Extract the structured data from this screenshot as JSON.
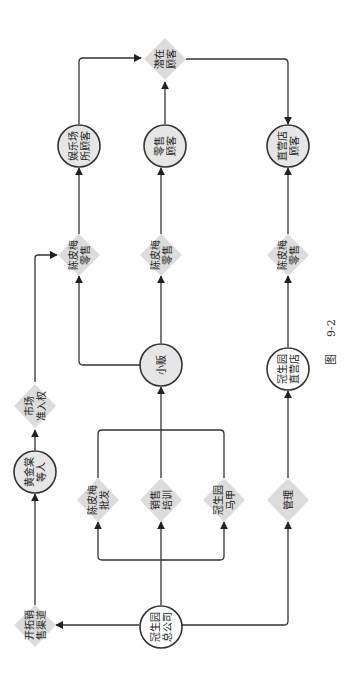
{
  "diagram": {
    "orientation": "rotated-90-ccw",
    "caption": {
      "prefix": "图",
      "number": "9-2"
    },
    "nodes": {
      "hq": {
        "shape": "circle",
        "lines": [
          "冠生园",
          "总公司"
        ]
      },
      "expand": {
        "shape": "diamond",
        "lines": [
          "开拓销",
          "售渠道"
        ]
      },
      "gold": {
        "shape": "circle",
        "lines": [
          "黄金棠",
          "等人"
        ]
      },
      "market": {
        "shape": "diamond",
        "lines": [
          "市场",
          "准入权"
        ]
      },
      "wholesale": {
        "shape": "diamond",
        "lines": [
          "陈皮梅",
          "批发"
        ]
      },
      "training": {
        "shape": "diamond",
        "lines": [
          "销售",
          "培训"
        ]
      },
      "vest": {
        "shape": "diamond",
        "lines": [
          "冠生园",
          "马甲"
        ]
      },
      "manage": {
        "shape": "diamond",
        "lines": [
          "管理"
        ]
      },
      "vendor": {
        "shape": "circle",
        "lines": [
          "小贩"
        ]
      },
      "store": {
        "shape": "circle",
        "lines": [
          "冠生园",
          "直营店"
        ]
      },
      "retail1": {
        "shape": "diamond",
        "lines": [
          "陈皮梅",
          "零售"
        ]
      },
      "retail2": {
        "shape": "diamond",
        "lines": [
          "陈皮梅",
          "零售"
        ]
      },
      "retail3": {
        "shape": "diamond",
        "lines": [
          "陈皮梅",
          "零售"
        ]
      },
      "ent": {
        "shape": "circle",
        "lines": [
          "娱乐场",
          "所顾客"
        ]
      },
      "retailcust": {
        "shape": "circle",
        "lines": [
          "零售",
          "顾客"
        ]
      },
      "storecust": {
        "shape": "circle",
        "lines": [
          "直营店",
          "顾客"
        ]
      },
      "potential": {
        "shape": "diamond",
        "lines": [
          "潜在",
          "顾客"
        ]
      }
    },
    "edges": [
      [
        "hq",
        "expand"
      ],
      [
        "hq",
        "wholesale"
      ],
      [
        "hq",
        "training"
      ],
      [
        "hq",
        "vest"
      ],
      [
        "hq",
        "manage"
      ],
      [
        "expand",
        "gold"
      ],
      [
        "gold",
        "market"
      ],
      [
        "market",
        "retail1"
      ],
      [
        "wholesale",
        "vendor"
      ],
      [
        "training",
        "vendor"
      ],
      [
        "vest",
        "vendor"
      ],
      [
        "vendor",
        "retail1"
      ],
      [
        "vendor",
        "retail2"
      ],
      [
        "manage",
        "store"
      ],
      [
        "store",
        "retail3"
      ],
      [
        "retail1",
        "ent"
      ],
      [
        "retail2",
        "retailcust"
      ],
      [
        "retail3",
        "storecust"
      ],
      [
        "ent",
        "potential"
      ],
      [
        "retailcust",
        "potential"
      ],
      [
        "potential",
        "storecust"
      ]
    ]
  }
}
